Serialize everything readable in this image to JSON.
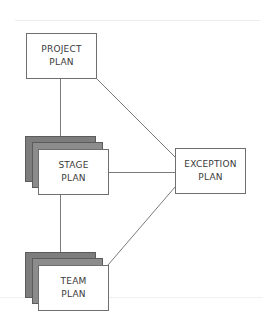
{
  "diagram": {
    "type": "plan-hierarchy",
    "nodes": [
      {
        "id": "project",
        "label_lines": [
          "PROJECT",
          "PLAN"
        ],
        "stacked": false
      },
      {
        "id": "stage",
        "label_lines": [
          "STAGE",
          "PLAN"
        ],
        "stacked": true
      },
      {
        "id": "team",
        "label_lines": [
          "TEAM",
          "PLAN"
        ],
        "stacked": true
      },
      {
        "id": "exception",
        "label_lines": [
          "EXCEPTION",
          "PLAN"
        ],
        "stacked": false
      }
    ],
    "edges": [
      {
        "from": "project",
        "to": "stage"
      },
      {
        "from": "stage",
        "to": "team"
      },
      {
        "from": "project",
        "to": "exception"
      },
      {
        "from": "stage",
        "to": "exception"
      },
      {
        "from": "team",
        "to": "exception"
      }
    ],
    "colors": {
      "line": "#7a7a7a",
      "box_border": "#6f6f6f",
      "stack_back": "#7d7d7d",
      "stack_mid": "#8c8c8c",
      "text": "#3a3a3a"
    }
  }
}
